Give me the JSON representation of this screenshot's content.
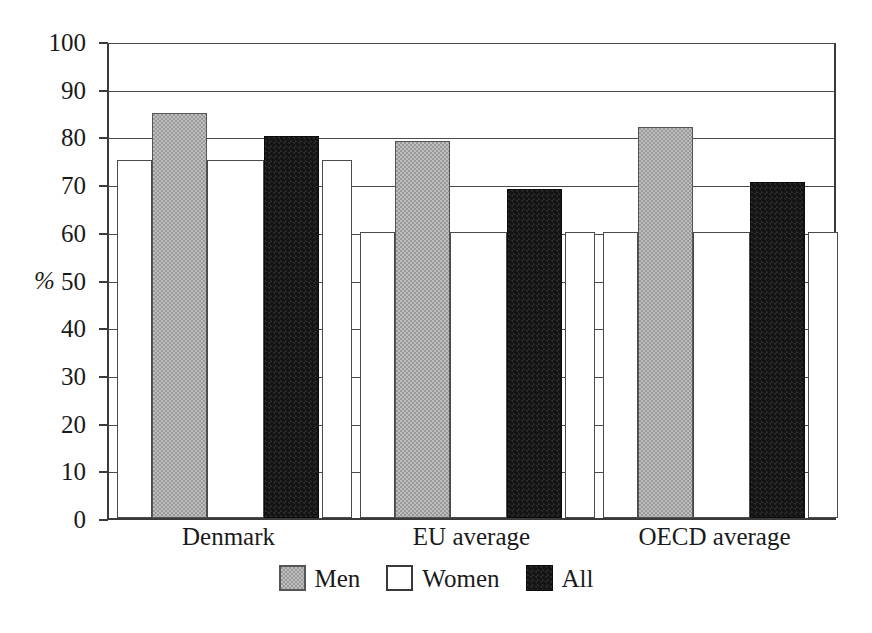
{
  "chart_data": {
    "type": "bar",
    "title": "",
    "subtitle": "",
    "xlabel": "",
    "ylabel": "%",
    "ylim": [
      0,
      100
    ],
    "ytick_labels": [
      "100",
      "90",
      "80",
      "70",
      "60",
      "50",
      "40",
      "30",
      "20",
      "10",
      "0"
    ],
    "ytick_values": [
      100,
      90,
      80,
      70,
      60,
      50,
      40,
      30,
      20,
      10,
      0
    ],
    "grid": true,
    "legend_position": "bottom-center",
    "categories": [
      "Denmark",
      "EU average",
      "OECD average"
    ],
    "series": [
      {
        "name": "Men",
        "color": "#9a9a9a",
        "values": [
          85,
          79,
          82
        ]
      },
      {
        "name": "Women",
        "color": "#ffffff",
        "values": [
          75,
          60,
          60
        ]
      },
      {
        "name": "All",
        "color": "#151515",
        "values": [
          80,
          69,
          70.5
        ]
      }
    ],
    "series_order_in_group": [
      "Women",
      "Men",
      "Women",
      "All",
      "Women"
    ],
    "annotations": []
  },
  "legend": {
    "entries": [
      {
        "label": "Men",
        "swatch": "gray-filled-square"
      },
      {
        "label": "Women",
        "swatch": "white-empty-square"
      },
      {
        "label": "All",
        "swatch": "black-filled-square"
      }
    ]
  },
  "axis": {
    "unit_symbol": "%"
  }
}
